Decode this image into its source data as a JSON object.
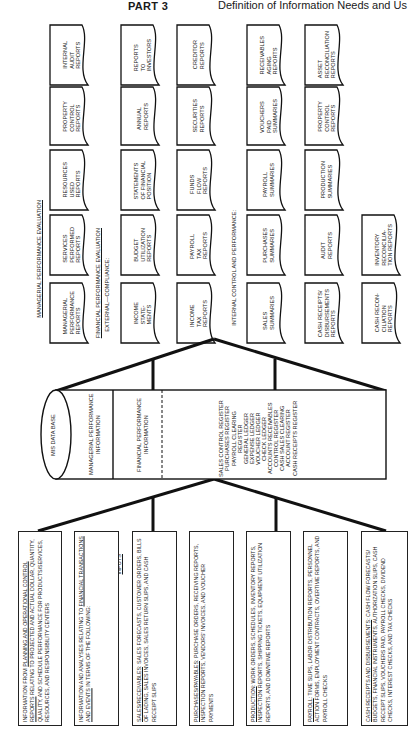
{
  "header": {
    "part": "PART 3",
    "title": "Definition of Information Needs and Us"
  },
  "outputs": {
    "label": "OUTPUTS",
    "managerial_heading": "MANAGERIAL PERFORMANCE EVALUATION",
    "financial_heading": "FINANCIAL PERFORMANCE EVALUATION",
    "external_heading": "EXTERNAL—COMPLIANCE:",
    "internal_heading": "INTERNAL CONTROL AND PERFORMANCE:",
    "managerial_reports": [
      "MANAGERIAL\nPERFORMANCE\nREPORTS",
      "SERVICES\nPERFORMED\nREPORTS",
      "RESOURCES\nUSED\nREPORTS",
      "PROPERTY\nCONTROL\nREPORTS",
      "INTERNAL\nAUDIT\nREPORTS"
    ],
    "external_row1": [
      "INCOME\nSTATE-\nMENTS",
      "BUDGET\nUTILIZATION\nREPORTS",
      "STATEMENTS\nOF FINANCIAL\nPOSITION",
      "ANNUAL\nREPORTS",
      "REPORTS\nTO\nINVESTORS"
    ],
    "external_row2": [
      "INCOME\nTAX\nREPORTS",
      "PAYROLL\nTAX\nREPORTS",
      "FUNDS\nFLOW\nREPORTS",
      "SECURITIES\nREPORTS",
      "CREDITOR\nREPORTS"
    ],
    "internal_row1": [
      "SALES\nSUMMARIES",
      "PURCHASES\nSUMMARIES",
      "PAYROLL\nSUMMARIES",
      "VOUCHERS\nPAID\nSUMMARIES",
      "RECEIVABLES\nAGING\nREPORTS"
    ],
    "internal_row2": [
      "CASH RECEIPTS/\nDISBURSEMENTS\nREPORTS",
      "AUDIT\nREPORTS",
      "PRODUCTION\nSUMMARIES",
      "PROPERTY\nCONTROL\nREPORTS",
      "ASSET\nRECONCILIATION\nREPORTS"
    ],
    "internal_row3": [
      "CASH RECON-\nCILIATION\nREPORTS",
      "INVENTORY\nRECONCILIA-\nTION REPORTS"
    ]
  },
  "database": {
    "name": "MIS DATA BASE",
    "managerial_info": "MANAGERIAL PERFORMANCE\nINFORMATION",
    "financial_info": "FINANCIAL PERFORMANCE\nINFORMATION",
    "registers": [
      "SALES CONTROL REGISTER",
      "PURCHASES REGISTER",
      "PAYROLL CLEARING",
      "REGISTER",
      "GENERAL LEDGER",
      "EXPENSE LEDGER",
      "VOUCHER LEDGER",
      "CHECK LEDGER",
      "ACCOUNTS RECEIVABLES",
      "CONTROL REGISTER",
      "CASH SALES CLEARING",
      "ACCOUNT REGISTER",
      "CASH RECEIPTS REGISTER"
    ]
  },
  "inputs": {
    "label": "INPUTS",
    "boxes": [
      {
        "lead": "INFORMATION FROM ",
        "underlined": "PLANNING AND OPERATIONAL CONTROL REPORTS",
        "rest": " RELATING TO PROJECTED AND ACTUAL DOLLAR, QUANTITY, QUALITY, AND SCHEDULE PERFORMANCE FOR PRODUCTS/SERVICES, RESOURCES, AND RESPONSIBILITY CENTERS"
      },
      {
        "lead": "INFORMATION AND ANALYSES RELATING TO ",
        "underlined": "FINANCIAL TRANSACTIONS AND EVENTS",
        "rest": " IN TERMS OF THE FOLLOWING:"
      },
      {
        "lead": "",
        "underlined": "SALES/RECEIVABLES",
        "rest": ": SALES FORECASTS, CUSTOMER ORDERS, BILLS OF LADING, SALES INVOICES, SALES RETURN SLIPS, AND CASH RECEIPT SLIPS"
      },
      {
        "lead": "",
        "underlined": "PURCHASES/PAYABLES",
        "rest": ": PURCHASE ORDERS, RECEIVING REPORTS, INSPECTION REPORTS, VENDORS' INVOICES, AND VOUCHER PAYMENTS"
      },
      {
        "lead": "",
        "underlined": "PRODUCTION",
        "rest": ": WORK ORDERS, SCHEDULES, INVENTORY REPORTS, INSPECTION REPORTS, SHIPPING TICKETS, EQUIPMENT UTILIZATION REPORTS, AND DOWNTIME REPORTS"
      },
      {
        "lead": "",
        "underlined": "PAYROLL",
        "rest": ": TIME SLIPS, LABOR DISTRIBUTION REPORTS, PERSONNEL ACTION FORMS, EMPLOYMENT CONTRACTS, OVERTIME REPORTS, AND PAYROLL CHECKS"
      },
      {
        "lead": "",
        "underlined": "CASH RECEIPTS AND DISBURSEMENTS",
        "rest": ": CASH FLOW FORECASTS/ BUDGETS, FINANCIAL INSTRUMENTS, AUTHORIZATION SLIPS, CASH RECEIPT SLIPS, VOUCHERS PAID, PAYROLL CHECKS, DIVIDEND CHECKS, INTEREST CHECKS, AND TAX CHECKS"
      }
    ]
  }
}
